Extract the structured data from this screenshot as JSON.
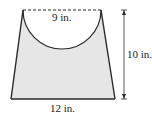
{
  "figure": {
    "shape": "trapezoid with semicircular cutout at top",
    "labels": {
      "top_width": "9 in.",
      "height": "10 in.",
      "bottom_width": "12 in."
    },
    "colors": {
      "fill": "#e6e6e6",
      "stroke": "#2a2a2a",
      "background": "#ffffff"
    }
  }
}
